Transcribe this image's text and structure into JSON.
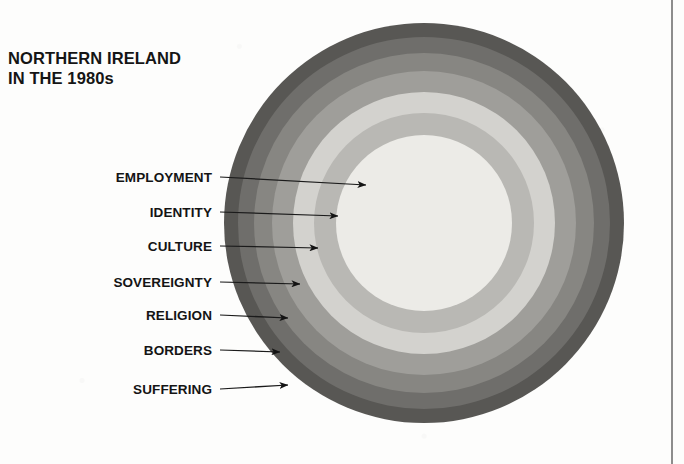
{
  "figure": {
    "title_lines": [
      "NORTHERN IRELAND",
      "IN THE 1980s"
    ],
    "title_full": "NORTHERN IRELAND IN THE 1980s"
  },
  "chart_data": {
    "type": "pie",
    "subtype": "concentric-rings",
    "title": "NORTHERN IRELAND IN THE 1980s",
    "xlabel": "",
    "ylabel": "",
    "legend_position": "left-callouts",
    "grid": false,
    "center": {
      "x": 424,
      "y": 223
    },
    "outer_radius": 200,
    "categories": [
      "EMPLOYMENT",
      "IDENTITY",
      "CULTURE",
      "SOVEREIGNTY",
      "RELIGION",
      "BORDERS",
      "SUFFERING"
    ],
    "rings": [
      {
        "label": "EMPLOYMENT",
        "ring_index": 0,
        "position": "core",
        "outer_radius": 88,
        "inner_radius": 0,
        "color": "#ecebe7",
        "label_xy": {
          "x": 212,
          "y": 177
        },
        "arrow_tip": {
          "x": 366,
          "y": 185
        }
      },
      {
        "label": "IDENTITY",
        "ring_index": 1,
        "position": "ring",
        "outer_radius": 110,
        "inner_radius": 88,
        "color": "#b9b8b4",
        "label_xy": {
          "x": 212,
          "y": 212
        },
        "arrow_tip": {
          "x": 338,
          "y": 216
        }
      },
      {
        "label": "CULTURE",
        "ring_index": 2,
        "position": "ring",
        "outer_radius": 131,
        "inner_radius": 110,
        "color": "#d3d2ce",
        "label_xy": {
          "x": 212,
          "y": 246
        },
        "arrow_tip": {
          "x": 318,
          "y": 248
        }
      },
      {
        "label": "SOVEREIGNTY",
        "ring_index": 3,
        "position": "ring",
        "outer_radius": 152,
        "inner_radius": 131,
        "color": "#9f9e9a",
        "label_xy": {
          "x": 212,
          "y": 282
        },
        "arrow_tip": {
          "x": 300,
          "y": 284
        }
      },
      {
        "label": "RELIGION",
        "ring_index": 4,
        "position": "ring",
        "outer_radius": 170,
        "inner_radius": 152,
        "color": "#878682",
        "label_xy": {
          "x": 212,
          "y": 315
        },
        "arrow_tip": {
          "x": 288,
          "y": 318
        }
      },
      {
        "label": "BORDERS",
        "ring_index": 5,
        "position": "ring",
        "outer_radius": 186,
        "inner_radius": 170,
        "color": "#6f6e6b",
        "label_xy": {
          "x": 212,
          "y": 350
        },
        "arrow_tip": {
          "x": 280,
          "y": 352
        }
      },
      {
        "label": "SUFFERING",
        "ring_index": 6,
        "position": "outer-ring",
        "outer_radius": 200,
        "inner_radius": 186,
        "color": "#585754",
        "label_xy": {
          "x": 212,
          "y": 389
        },
        "arrow_tip": {
          "x": 288,
          "y": 385
        }
      }
    ],
    "annotations": [
      "Seven nested concerns, innermost EMPLOYMENT to outermost SUFFERING"
    ]
  },
  "colors": {
    "background": "#fdfdfc",
    "text": "#141414",
    "rule": "#8d8d8d",
    "leader_line": "#1b1b1b"
  }
}
